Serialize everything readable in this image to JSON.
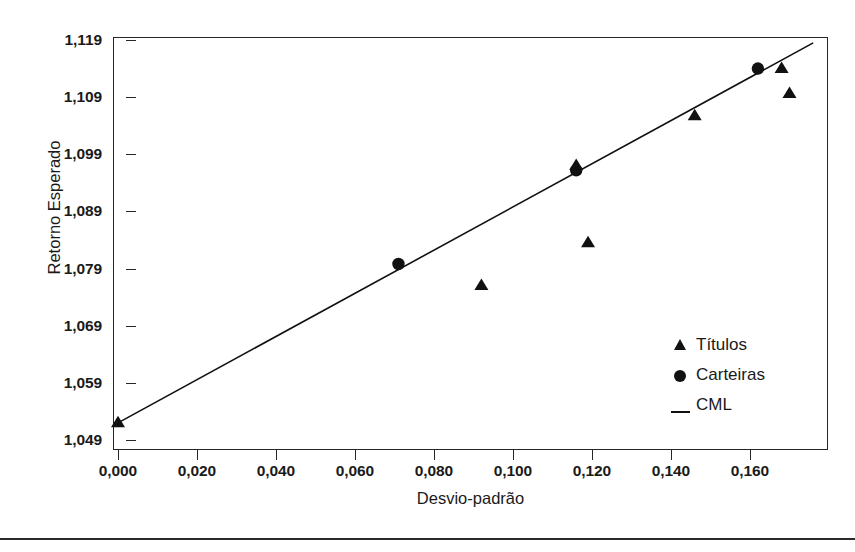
{
  "chart_data": {
    "type": "scatter",
    "title": "",
    "xlabel": "Desvio-padrão",
    "ylabel": "Retorno Esperado",
    "xlim": [
      0.0,
      0.181
    ],
    "ylim": [
      1.049,
      1.119
    ],
    "grid": false,
    "legend_position": "inside-lower-right",
    "x_ticks": [
      0.0,
      0.02,
      0.04,
      0.06,
      0.08,
      0.1,
      0.12,
      0.14,
      0.16
    ],
    "x_tick_labels": [
      "0,000",
      "0,020",
      "0,040",
      "0,060",
      "0,080",
      "0,100",
      "0,120",
      "0,140",
      "0,160"
    ],
    "y_ticks": [
      1.049,
      1.059,
      1.069,
      1.079,
      1.089,
      1.099,
      1.109,
      1.119
    ],
    "y_tick_labels": [
      "1,049",
      "1,059",
      "1,069",
      "1,079",
      "1,089",
      "1,099",
      "1,109",
      "1,119"
    ],
    "series": [
      {
        "name": "Títulos",
        "marker": "triangle",
        "color": "#111111",
        "points": [
          {
            "x": 0.0,
            "y": 1.052
          },
          {
            "x": 0.092,
            "y": 1.076
          },
          {
            "x": 0.116,
            "y": 1.097
          },
          {
            "x": 0.119,
            "y": 1.0835
          },
          {
            "x": 0.146,
            "y": 1.1057
          },
          {
            "x": 0.168,
            "y": 1.114
          },
          {
            "x": 0.17,
            "y": 1.1096
          }
        ]
      },
      {
        "name": "Carteiras",
        "marker": "circle",
        "color": "#111111",
        "points": [
          {
            "x": 0.071,
            "y": 1.0798
          },
          {
            "x": 0.116,
            "y": 1.0962
          },
          {
            "x": 0.162,
            "y": 1.114
          }
        ]
      },
      {
        "name": "CML",
        "marker": "line",
        "color": "#111111",
        "line": [
          {
            "x": 0.0,
            "y": 1.052
          },
          {
            "x": 0.176,
            "y": 1.1185
          }
        ]
      }
    ]
  },
  "legend": {
    "entries": [
      {
        "label": "Títulos",
        "marker": "triangle"
      },
      {
        "label": "Carteiras",
        "marker": "circle"
      },
      {
        "label": "CML",
        "marker": "line"
      }
    ]
  },
  "axes": {
    "x_title": "Desvio-padrão",
    "y_title": "Retorno Esperado"
  }
}
